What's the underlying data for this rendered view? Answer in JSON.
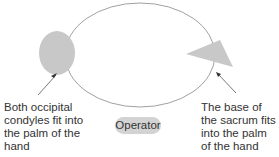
{
  "diagram": {
    "left_label": "Both occipital condyles fit into the palm of the hand",
    "right_label": "The base of the sacrum fits into the palm of the hand",
    "center_label": "Operator",
    "shapes": {
      "ellipse": "body outline",
      "left_shape": "circle (head / occipital condyles)",
      "right_shape": "triangle (sacrum)"
    },
    "colors": {
      "shape_fill": "#c8c8c8",
      "outline": "#777777",
      "text": "#333333",
      "badge": "#d3d3d3"
    }
  }
}
